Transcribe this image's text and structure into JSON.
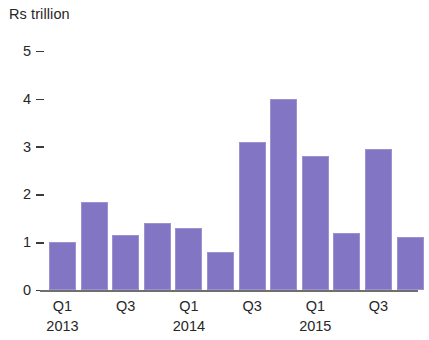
{
  "chart_data": {
    "type": "bar",
    "title": "",
    "subtitle": "",
    "xlabel": "",
    "ylabel": "Rs trillion",
    "ylim": [
      0,
      5
    ],
    "ytick_labels": [
      "5",
      "4",
      "3",
      "2",
      "1",
      "0"
    ],
    "ytick_values": [
      5,
      4,
      3,
      2,
      1,
      0
    ],
    "grid": false,
    "legend": null,
    "bar_color": "#8175c4",
    "axis_color": "#6f6f70",
    "categories": [
      "Q1 2013",
      "Q2 2013",
      "Q3 2013",
      "Q4 2013",
      "Q1 2014",
      "Q2 2014",
      "Q3 2014",
      "Q4 2014",
      "Q1 2015",
      "Q2 2015",
      "Q3 2015",
      "Q4 2015"
    ],
    "values": [
      1.0,
      1.85,
      1.15,
      1.4,
      1.3,
      0.8,
      3.1,
      4.0,
      2.8,
      1.2,
      2.95,
      1.1
    ],
    "quarter_tick_labels": [
      "Q1",
      "Q3",
      "Q1",
      "Q3",
      "Q1",
      "Q3"
    ],
    "quarter_tick_index": [
      0,
      2,
      4,
      6,
      8,
      10
    ],
    "year_tick_labels": [
      "2013",
      "2014",
      "2015"
    ],
    "year_tick_index": [
      0,
      4,
      8
    ]
  },
  "axis": {
    "unit_caption": "Rs trillion"
  }
}
